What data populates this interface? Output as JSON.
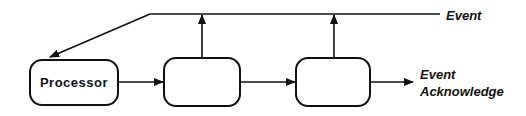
{
  "diagram": {
    "colors": {
      "stroke": "#111111",
      "background": "#ffffff",
      "text": "#111111"
    },
    "nodes": [
      {
        "id": "processor",
        "label": "Processor"
      },
      {
        "id": "stage1",
        "label": ""
      },
      {
        "id": "stage2",
        "label": ""
      }
    ],
    "edges": [
      {
        "from": "processor",
        "to": "stage1",
        "direction": "right"
      },
      {
        "from": "stage1",
        "to": "stage2",
        "direction": "right"
      },
      {
        "from": "stage2",
        "to": "event_acknowledge_output",
        "direction": "right"
      },
      {
        "from": "stage1",
        "to": "event_line",
        "direction": "up"
      },
      {
        "from": "stage2",
        "to": "event_line",
        "direction": "up"
      },
      {
        "from": "event_line",
        "to": "processor",
        "direction": "down-left"
      }
    ],
    "labels": {
      "event": "Event",
      "event_acknowledge_line1": "Event",
      "event_acknowledge_line2": "Acknowledge"
    }
  }
}
